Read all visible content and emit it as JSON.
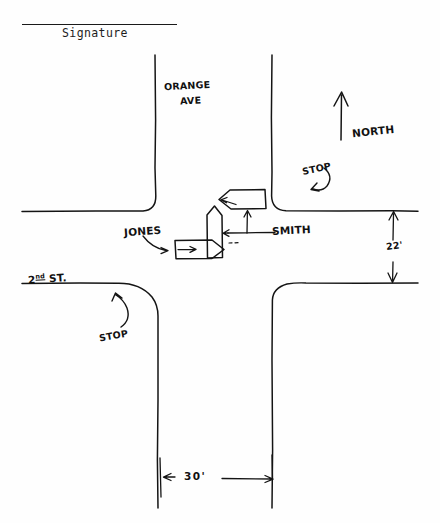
{
  "document": {
    "signature_label": "Signature",
    "background_color": "#fefefe",
    "ink_color": "#111111"
  },
  "diagram": {
    "type": "hand-drawn traffic accident sketch",
    "streets": [
      {
        "id": "orange-ave",
        "label": "ORANGE AVE",
        "orientation": "vertical",
        "position": "north leg"
      },
      {
        "id": "second-st",
        "label": "2ND ST.",
        "orientation": "horizontal",
        "position": "west leg"
      }
    ],
    "street_labels": {
      "orange_ave_line1": "ORANGE",
      "orange_ave_line2": "AVE",
      "second_st_numeral": "2",
      "second_st_ordinal": "nd",
      "second_st_suffix": "ST."
    },
    "compass": {
      "label": "NORTH",
      "direction": "up"
    },
    "traffic_controls": [
      {
        "id": "stop-northeast",
        "label": "STOP",
        "points_to": "northbound leg of Orange Ave at intersection"
      },
      {
        "id": "stop-southwest",
        "label": "STOP",
        "points_to": "eastbound leg of 2nd St at intersection"
      }
    ],
    "vehicles": [
      {
        "id": "vehicle-jones",
        "label": "JONES",
        "heading": "east",
        "shape": "arrow-right"
      },
      {
        "id": "vehicle-smith",
        "label": "SMITH",
        "heading": "north",
        "shape": "arrow-up"
      },
      {
        "id": "vehicle-third",
        "label": "",
        "heading": "west",
        "shape": "arrow-left"
      }
    ],
    "dimensions": [
      {
        "id": "dim-22",
        "value": "22'",
        "orientation": "vertical",
        "measures": "width of 2nd St east leg"
      },
      {
        "id": "dim-30",
        "value": "30'",
        "orientation": "horizontal",
        "measures": "width of Orange Ave south leg"
      }
    ]
  }
}
